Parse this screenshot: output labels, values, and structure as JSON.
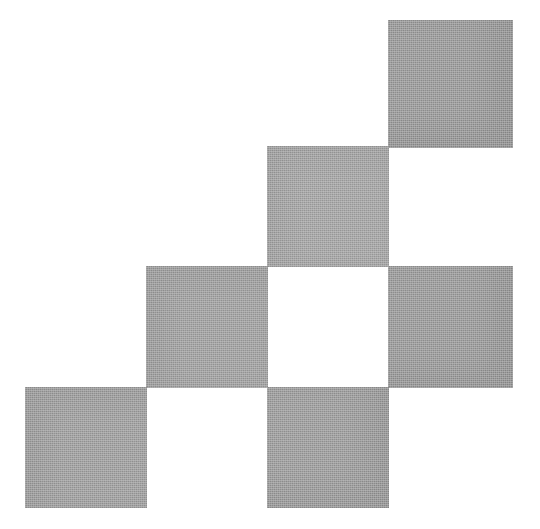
{
  "figure": {
    "width": 540,
    "height": 529,
    "background_color": "#ffffff",
    "tile_color": "#9c9c9c",
    "grid": {
      "origin_x": 26,
      "origin_y": 20,
      "cell_size": 121,
      "columns": 4,
      "rows": 4
    }
  },
  "tiles": [
    {
      "name": "tile-top-right",
      "col": 3,
      "row": 0,
      "x": 388,
      "y": 20,
      "width": 125,
      "height": 128,
      "color": "#989898",
      "shade": "shade-a"
    },
    {
      "name": "tile-upper-middle",
      "col": 2,
      "row": 1,
      "x": 267,
      "y": 146,
      "width": 122,
      "height": 121,
      "color": "#a2a2a2",
      "shade": "shade-b"
    },
    {
      "name": "tile-middle-left",
      "col": 1,
      "row": 2,
      "x": 146,
      "y": 266,
      "width": 122,
      "height": 122,
      "color": "#9e9e9e",
      "shade": "shade-b"
    },
    {
      "name": "tile-middle-right",
      "col": 3,
      "row": 2,
      "x": 388,
      "y": 266,
      "width": 125,
      "height": 122,
      "color": "#999999",
      "shade": "shade-a"
    },
    {
      "name": "tile-bottom-left",
      "col": 0,
      "row": 3,
      "x": 25,
      "y": 387,
      "width": 122,
      "height": 121,
      "color": "#9d9d9d",
      "shade": "shade-b"
    },
    {
      "name": "tile-bottom-middle",
      "col": 2,
      "row": 3,
      "x": 267,
      "y": 387,
      "width": 122,
      "height": 121,
      "color": "#9b9b9b",
      "shade": "shade-a"
    }
  ]
}
